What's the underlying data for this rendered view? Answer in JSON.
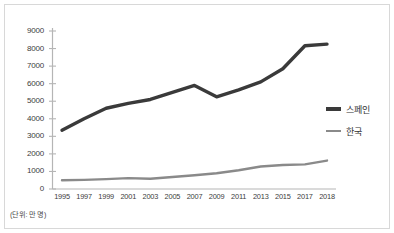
{
  "chart_data": {
    "type": "line",
    "title": "",
    "xlabel": "",
    "ylabel": "",
    "unit_note": "(단위: 만 명)",
    "grid": false,
    "legend_position": "right",
    "ylim": [
      0,
      9000
    ],
    "ytick_step": 1000,
    "yticks": [
      "9000",
      "8000",
      "7000",
      "6000",
      "5000",
      "4000",
      "3000",
      "2000",
      "1000",
      "0"
    ],
    "ytick_values": [
      9000,
      8000,
      7000,
      6000,
      5000,
      4000,
      3000,
      2000,
      1000,
      0
    ],
    "categories": [
      "1995",
      "1997",
      "1999",
      "2001",
      "2003",
      "2005",
      "2007",
      "2009",
      "2011",
      "2013",
      "2015",
      "2017",
      "2018"
    ],
    "series": [
      {
        "name": "스페인",
        "color": "#3a3a3a",
        "line_width": 3.4,
        "values": [
          3350,
          4000,
          4600,
          4880,
          5100,
          5500,
          5900,
          5250,
          5650,
          6100,
          6850,
          8160,
          8250
        ]
      },
      {
        "name": "한국",
        "color": "#8a8a8a",
        "line_width": 2.4,
        "values": [
          500,
          520,
          560,
          620,
          580,
          680,
          780,
          900,
          1070,
          1280,
          1370,
          1400,
          1620
        ]
      }
    ]
  },
  "axis": {
    "y_axis_name": "y-axis",
    "x_axis_name": "x-axis"
  }
}
